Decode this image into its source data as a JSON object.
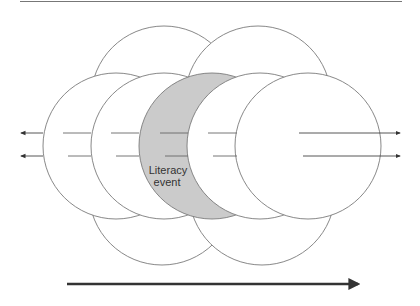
{
  "diagram": {
    "highlight_label_line1": "Literacy",
    "highlight_label_line2": "event",
    "colors": {
      "stroke": "#7a7a7a",
      "highlight_fill": "#cbcbcb",
      "background": "#ffffff",
      "arrow": "#333333"
    },
    "elements": {
      "top_rule": "horizontal-rule",
      "circles_top_row": 2,
      "circles_middle_row": 5,
      "circles_bottom_row": 2,
      "highlighted_circle_index": 3,
      "left_arrows": 2,
      "right_arrows": 2,
      "bottom_arrow": "time-arrow"
    }
  }
}
